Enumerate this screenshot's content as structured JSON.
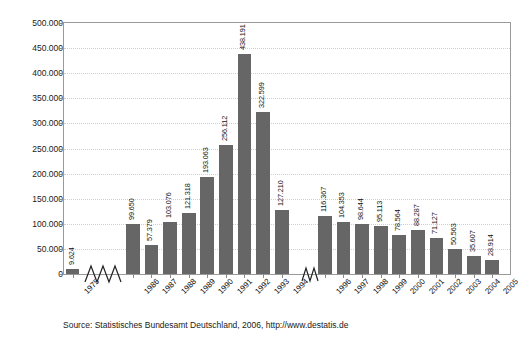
{
  "chart_data": {
    "type": "bar",
    "title": "",
    "subtitle": "",
    "xlabel": "",
    "ylabel": "",
    "ylim": [
      0,
      500000
    ],
    "grid": true,
    "legend": "none",
    "thousands_separator": ".",
    "axis_breaks": [
      "after 1975",
      "after 1994"
    ],
    "categories": [
      "1975",
      "1986",
      "1987",
      "1988",
      "1989",
      "1990",
      "1991",
      "1992",
      "1993",
      "1994",
      "1996",
      "1997",
      "1998",
      "1999",
      "2000",
      "2001",
      "2002",
      "2003",
      "2004",
      "2005"
    ],
    "values": [
      9624,
      99650,
      57379,
      103076,
      121318,
      193063,
      256112,
      438191,
      322599,
      127210,
      116367,
      104353,
      98644,
      95113,
      78564,
      88287,
      71127,
      50563,
      35607,
      28914
    ],
    "value_labels": [
      "9.624",
      "99.650",
      "57.379",
      "103.076",
      "121.318",
      "193.063",
      "256.112",
      "438.191",
      "322.599",
      "127.210",
      "116.367",
      "104.353",
      "98.644",
      "95.113",
      "78.564",
      "88.287",
      "71.127",
      "50.563",
      "35.607",
      "28.914"
    ],
    "ytick_values": [
      0,
      50000,
      100000,
      150000,
      200000,
      250000,
      300000,
      350000,
      400000,
      450000,
      500000
    ],
    "ytick_labels": [
      "0",
      "50.000",
      "100.000",
      "150.000",
      "200.000",
      "250.000",
      "300.000",
      "350.000",
      "400.000",
      "450.000",
      "500.000"
    ],
    "bar_color": "#666666",
    "grid_color": "#cfcfcf",
    "frame_color": "#9a9a9a"
  },
  "source": {
    "text": "Source: Statistisches Bundesamt Deutschland, 2006, http://www.destatis.de"
  }
}
